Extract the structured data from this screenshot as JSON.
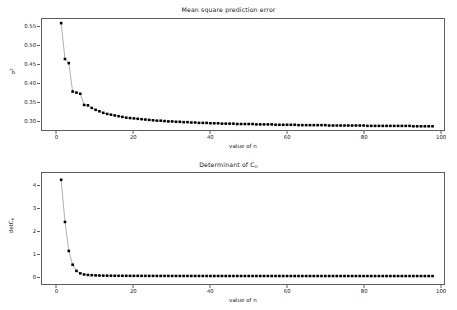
{
  "figure": {
    "background": "#ffffff",
    "marker_color": "#000000",
    "line_color": "#8c8c8c"
  },
  "panels": [
    {
      "id": "top",
      "title_main": "Mean square prediction error",
      "title_sub": "",
      "ylabel_main": "σ",
      "ylabel_sup": "2",
      "ylabel_sub": "",
      "xlabel": "value of n",
      "yticks": [
        "0.30",
        "0.35",
        "0.40",
        "0.45",
        "0.50",
        "0.55"
      ],
      "xticks": [
        "0",
        "20",
        "40",
        "60",
        "80",
        "100"
      ]
    },
    {
      "id": "bottom",
      "title_main": "Determinant of C",
      "title_sub": "n",
      "ylabel_main": "detC",
      "ylabel_sup": "",
      "ylabel_sub": "n",
      "xlabel": "value of n",
      "yticks": [
        "0",
        "1",
        "2",
        "3",
        "4"
      ],
      "xticks": [
        "0",
        "20",
        "40",
        "60",
        "80",
        "100"
      ]
    }
  ],
  "chart_data": [
    {
      "type": "line",
      "title": "Mean square prediction error",
      "xlabel": "value of n",
      "ylabel": "sigma^2",
      "xlim": [
        -4,
        101
      ],
      "ylim": [
        0.275,
        0.572
      ],
      "grid": false,
      "legend": null,
      "marker": "filled-square",
      "x": [
        1,
        2,
        3,
        4,
        5,
        6,
        7,
        8,
        9,
        10,
        11,
        12,
        13,
        14,
        15,
        16,
        17,
        18,
        19,
        20,
        21,
        22,
        23,
        24,
        25,
        26,
        27,
        28,
        29,
        30,
        31,
        32,
        33,
        34,
        35,
        36,
        37,
        38,
        39,
        40,
        41,
        42,
        43,
        44,
        45,
        46,
        47,
        48,
        49,
        50,
        51,
        52,
        53,
        54,
        55,
        56,
        57,
        58,
        59,
        60,
        61,
        62,
        63,
        64,
        65,
        66,
        67,
        68,
        69,
        70,
        71,
        72,
        73,
        74,
        75,
        76,
        77,
        78,
        79,
        80,
        81,
        82,
        83,
        84,
        85,
        86,
        87,
        88,
        89,
        90,
        91,
        92,
        93,
        94,
        95,
        96,
        97,
        98
      ],
      "y": [
        0.561,
        0.465,
        0.454,
        0.378,
        0.375,
        0.372,
        0.342,
        0.341,
        0.334,
        0.329,
        0.325,
        0.321,
        0.318,
        0.316,
        0.314,
        0.312,
        0.31,
        0.308,
        0.307,
        0.306,
        0.305,
        0.304,
        0.303,
        0.302,
        0.301,
        0.3,
        0.3,
        0.299,
        0.298,
        0.298,
        0.297,
        0.297,
        0.296,
        0.296,
        0.295,
        0.295,
        0.294,
        0.294,
        0.294,
        0.293,
        0.293,
        0.293,
        0.292,
        0.292,
        0.292,
        0.292,
        0.291,
        0.291,
        0.291,
        0.291,
        0.291,
        0.29,
        0.29,
        0.29,
        0.29,
        0.29,
        0.289,
        0.289,
        0.289,
        0.289,
        0.289,
        0.289,
        0.288,
        0.288,
        0.288,
        0.288,
        0.288,
        0.288,
        0.288,
        0.288,
        0.287,
        0.287,
        0.287,
        0.287,
        0.287,
        0.287,
        0.287,
        0.287,
        0.287,
        0.287,
        0.286,
        0.286,
        0.286,
        0.286,
        0.286,
        0.286,
        0.286,
        0.286,
        0.286,
        0.286,
        0.286,
        0.286,
        0.285,
        0.285,
        0.285,
        0.285,
        0.285,
        0.285
      ]
    },
    {
      "type": "line",
      "title": "Determinant of C_n",
      "xlabel": "value of n",
      "ylabel": "detC_n",
      "xlim": [
        -4,
        101
      ],
      "ylim": [
        -0.35,
        4.55
      ],
      "grid": false,
      "legend": null,
      "marker": "filled-square",
      "x": [
        1,
        2,
        3,
        4,
        5,
        6,
        7,
        8,
        9,
        10,
        11,
        12,
        13,
        14,
        15,
        16,
        17,
        18,
        19,
        20,
        21,
        22,
        23,
        24,
        25,
        26,
        27,
        28,
        29,
        30,
        31,
        32,
        33,
        34,
        35,
        36,
        37,
        38,
        39,
        40,
        41,
        42,
        43,
        44,
        45,
        46,
        47,
        48,
        49,
        50,
        51,
        52,
        53,
        54,
        55,
        56,
        57,
        58,
        59,
        60,
        61,
        62,
        63,
        64,
        65,
        66,
        67,
        68,
        69,
        70,
        71,
        72,
        73,
        74,
        75,
        76,
        77,
        78,
        79,
        80,
        81,
        82,
        83,
        84,
        85,
        86,
        87,
        88,
        89,
        90,
        91,
        92,
        93,
        94,
        95,
        96,
        97,
        98
      ],
      "y": [
        4.25,
        2.39,
        1.11,
        0.5,
        0.23,
        0.12,
        0.07,
        0.05,
        0.04,
        0.03,
        0.025,
        0.02,
        0.018,
        0.016,
        0.014,
        0.013,
        0.012,
        0.011,
        0.01,
        0.01,
        0.009,
        0.009,
        0.008,
        0.008,
        0.008,
        0.007,
        0.007,
        0.007,
        0.006,
        0.006,
        0.006,
        0.006,
        0.005,
        0.005,
        0.005,
        0.005,
        0.005,
        0.005,
        0.004,
        0.004,
        0.004,
        0.004,
        0.004,
        0.004,
        0.004,
        0.004,
        0.003,
        0.003,
        0.003,
        0.003,
        0.003,
        0.003,
        0.003,
        0.003,
        0.003,
        0.003,
        0.003,
        0.003,
        0.002,
        0.002,
        0.002,
        0.002,
        0.002,
        0.002,
        0.002,
        0.002,
        0.002,
        0.002,
        0.002,
        0.002,
        0.002,
        0.002,
        0.002,
        0.002,
        0.002,
        0.002,
        0.002,
        0.002,
        0.001,
        0.001,
        0.001,
        0.001,
        0.001,
        0.001,
        0.001,
        0.001,
        0.001,
        0.001,
        0.001,
        0.001,
        0.001,
        0.001,
        0.001,
        0.001,
        0.001,
        0.001,
        0.001,
        0.001
      ]
    }
  ]
}
